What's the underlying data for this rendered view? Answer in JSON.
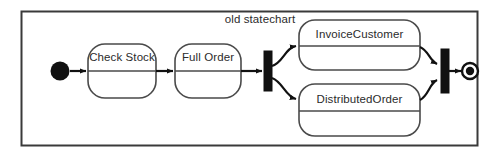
{
  "diagram": {
    "kind": "uml-statechart",
    "title": "old statechart",
    "background_color": "#ffffff",
    "frame_stroke_color": "#3a3a3a",
    "line_color": "#111111",
    "text_color": "#2b2b2b",
    "state_stroke_color": "#4a4a4a"
  },
  "nodes": {
    "initial": {
      "type": "initial-state",
      "label": ""
    },
    "check_stock": {
      "type": "state",
      "label": "Check Stock"
    },
    "full_order": {
      "type": "state",
      "label": "Full Order"
    },
    "fork": {
      "type": "fork-bar",
      "label": ""
    },
    "invoice_customer": {
      "type": "state",
      "label": "InvoiceCustomer"
    },
    "distributed_order": {
      "type": "state",
      "label": "DistributedOrder"
    },
    "join": {
      "type": "join-bar",
      "label": ""
    },
    "final": {
      "type": "final-state",
      "label": ""
    }
  },
  "transitions": [
    {
      "from": "initial",
      "to": "check_stock",
      "label": ""
    },
    {
      "from": "check_stock",
      "to": "full_order",
      "label": ""
    },
    {
      "from": "full_order",
      "to": "fork",
      "label": ""
    },
    {
      "from": "fork",
      "to": "invoice_customer",
      "label": ""
    },
    {
      "from": "fork",
      "to": "distributed_order",
      "label": ""
    },
    {
      "from": "invoice_customer",
      "to": "join",
      "label": ""
    },
    {
      "from": "distributed_order",
      "to": "join",
      "label": ""
    },
    {
      "from": "join",
      "to": "final",
      "label": ""
    }
  ]
}
